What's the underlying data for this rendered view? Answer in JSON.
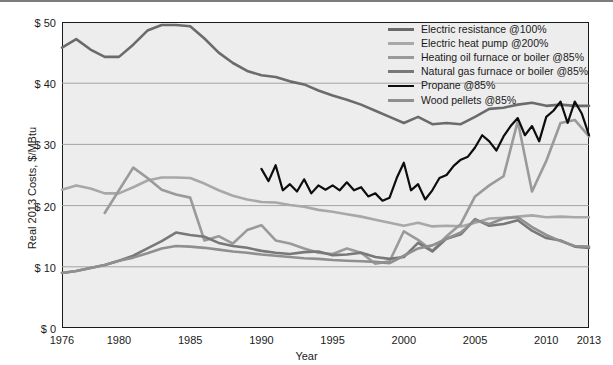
{
  "chart_data": {
    "type": "line",
    "title": "",
    "xlabel": "Year",
    "ylabel": "Real 2013 Costs, $/MBtu",
    "xlim": [
      1976,
      2013
    ],
    "ylim": [
      0,
      50
    ],
    "yticks": [
      "$ 0",
      "$ 10",
      "$ 20",
      "$ 30",
      "$ 40",
      "$ 50"
    ],
    "ytick_values": [
      0,
      10,
      20,
      30,
      40,
      50
    ],
    "xticks": [
      "1976",
      "1980",
      "1985",
      "1990",
      "1995",
      "2000",
      "2005",
      "2010",
      "2013"
    ],
    "xtick_values": [
      1976,
      1980,
      1985,
      1990,
      1995,
      2000,
      2005,
      2010,
      2013
    ],
    "grid": "horizontal",
    "legend_position": "top-right",
    "plot_background": "#ededed",
    "series": [
      {
        "name": "Electric resistance @100%",
        "color": "#6b6b6b",
        "width": 2.6,
        "x": [
          1976,
          1977,
          1978,
          1979,
          1980,
          1981,
          1982,
          1983,
          1984,
          1985,
          1986,
          1987,
          1988,
          1989,
          1990,
          1991,
          1992,
          1993,
          1994,
          1995,
          1996,
          1997,
          1998,
          1999,
          2000,
          2001,
          2002,
          2003,
          2004,
          2005,
          2006,
          2007,
          2008,
          2009,
          2010,
          2011,
          2012,
          2013
        ],
        "values": [
          45.8,
          47.2,
          45.5,
          44.3,
          44.3,
          46.3,
          48.6,
          49.5,
          49.5,
          49.3,
          47.3,
          45.0,
          43.3,
          42.0,
          41.3,
          41.0,
          40.3,
          39.8,
          38.8,
          38.0,
          37.3,
          36.5,
          35.5,
          34.5,
          33.5,
          34.5,
          33.3,
          33.5,
          33.3,
          34.5,
          35.8,
          36.0,
          36.5,
          36.8,
          36.3,
          36.5,
          36.3,
          36.3
        ]
      },
      {
        "name": "Electric heat pump @200%",
        "color": "#a8a8a8",
        "width": 2.6,
        "x": [
          1976,
          1977,
          1978,
          1979,
          1980,
          1981,
          1982,
          1983,
          1984,
          1985,
          1986,
          1987,
          1988,
          1989,
          1990,
          1991,
          1992,
          1993,
          1994,
          1995,
          1996,
          1997,
          1998,
          1999,
          2000,
          2001,
          2002,
          2003,
          2004,
          2005,
          2006,
          2007,
          2008,
          2009,
          2010,
          2011,
          2012,
          2013
        ],
        "values": [
          22.6,
          23.3,
          22.8,
          22.0,
          22.0,
          23.0,
          24.1,
          24.6,
          24.6,
          24.5,
          23.6,
          22.5,
          21.6,
          21.0,
          20.6,
          20.5,
          20.1,
          19.8,
          19.3,
          19.0,
          18.6,
          18.2,
          17.7,
          17.2,
          16.7,
          17.2,
          16.6,
          16.7,
          16.6,
          17.2,
          17.9,
          18.0,
          18.2,
          18.4,
          18.1,
          18.2,
          18.1,
          18.1
        ]
      },
      {
        "name": "Heating oil furnace or boiler @85%",
        "color": "#9a9a9a",
        "width": 2.6,
        "x": [
          1979,
          1980,
          1981,
          1982,
          1983,
          1984,
          1985,
          1986,
          1987,
          1988,
          1989,
          1990,
          1991,
          1992,
          1993,
          1994,
          1995,
          1996,
          1997,
          1998,
          1999,
          2000,
          2001,
          2002,
          2003,
          2004,
          2005,
          2006,
          2007,
          2008,
          2009,
          2010,
          2011,
          2012,
          2013
        ],
        "values": [
          18.8,
          22.5,
          26.2,
          24.5,
          22.6,
          21.8,
          21.3,
          14.3,
          15.0,
          13.8,
          16.0,
          16.8,
          14.3,
          13.8,
          13.0,
          12.3,
          12.1,
          13.0,
          12.3,
          10.5,
          10.9,
          15.8,
          14.4,
          12.6,
          15.0,
          17.0,
          21.5,
          23.3,
          24.8,
          33.8,
          22.3,
          27.3,
          33.5,
          34.0,
          31.3
        ]
      },
      {
        "name": "Natural gas furnace or boiler @85%",
        "color": "#787878",
        "width": 2.6,
        "x": [
          1976,
          1977,
          1978,
          1979,
          1980,
          1981,
          1982,
          1983,
          1984,
          1985,
          1986,
          1987,
          1988,
          1989,
          1990,
          1991,
          1992,
          1993,
          1994,
          1995,
          1996,
          1997,
          1998,
          1999,
          2000,
          2001,
          2002,
          2003,
          2004,
          2005,
          2006,
          2007,
          2008,
          2009,
          2010,
          2011,
          2012,
          2013
        ],
        "values": [
          9.0,
          9.3,
          9.8,
          10.3,
          11.0,
          11.8,
          13.0,
          14.2,
          15.6,
          15.2,
          14.9,
          13.9,
          13.4,
          13.1,
          12.6,
          12.3,
          12.1,
          12.4,
          12.5,
          11.9,
          12.0,
          12.3,
          11.6,
          11.3,
          11.6,
          13.9,
          12.5,
          14.6,
          15.3,
          17.8,
          16.7,
          17.0,
          17.6,
          15.9,
          14.7,
          14.3,
          13.3,
          13.1
        ]
      },
      {
        "name": "Propane @85%",
        "color": "#0d0d0d",
        "width": 2.2,
        "x": [
          1990.0,
          1990.5,
          1991.0,
          1991.5,
          1992.0,
          1992.5,
          1993.0,
          1993.5,
          1994.0,
          1994.5,
          1995.0,
          1995.5,
          1996.0,
          1996.5,
          1997.0,
          1997.5,
          1998.0,
          1998.5,
          1999.0,
          1999.5,
          2000.0,
          2000.5,
          2001.0,
          2001.5,
          2002.0,
          2002.5,
          2003.0,
          2003.5,
          2004.0,
          2004.5,
          2005.0,
          2005.5,
          2006.0,
          2006.5,
          2007.0,
          2007.5,
          2008.0,
          2008.5,
          2009.0,
          2009.5,
          2010.0,
          2010.5,
          2011.0,
          2011.5,
          2012.0,
          2012.5,
          2013.0
        ],
        "values": [
          26.0,
          24.0,
          26.6,
          22.5,
          23.5,
          22.3,
          24.3,
          22.0,
          23.3,
          22.6,
          23.3,
          22.5,
          23.8,
          22.5,
          23.0,
          21.5,
          22.0,
          20.8,
          21.3,
          24.5,
          27.0,
          22.5,
          23.5,
          21.0,
          22.5,
          24.5,
          25.0,
          26.5,
          27.5,
          28.0,
          29.5,
          31.5,
          30.5,
          29.0,
          31.3,
          33.0,
          34.3,
          31.5,
          33.0,
          30.5,
          34.5,
          35.5,
          37.0,
          33.5,
          37.0,
          35.0,
          31.5
        ]
      },
      {
        "name": "Wood pellets @85%",
        "color": "#8f8f8f",
        "width": 2.6,
        "x": [
          1976,
          1977,
          1978,
          1979,
          1980,
          1981,
          1982,
          1983,
          1984,
          1985,
          1986,
          1987,
          1988,
          1989,
          1990,
          1991,
          1992,
          1993,
          1994,
          1995,
          1996,
          1997,
          1998,
          1999,
          2000,
          2001,
          2002,
          2003,
          2004,
          2005,
          2006,
          2007,
          2008,
          2009,
          2010,
          2011,
          2012,
          2013
        ],
        "values": [
          9.0,
          9.3,
          9.8,
          10.3,
          11.0,
          11.5,
          12.2,
          13.0,
          13.4,
          13.3,
          13.1,
          12.8,
          12.5,
          12.3,
          12.0,
          11.8,
          11.6,
          11.4,
          11.3,
          11.1,
          11.0,
          10.9,
          10.8,
          10.6,
          11.8,
          13.0,
          13.5,
          14.6,
          15.6,
          17.6,
          17.0,
          17.9,
          18.1,
          16.5,
          15.2,
          14.2,
          13.4,
          13.3
        ]
      }
    ]
  },
  "axis": {
    "y_title": "Real 2013 Costs, $/MBtu",
    "x_title": "Year"
  }
}
